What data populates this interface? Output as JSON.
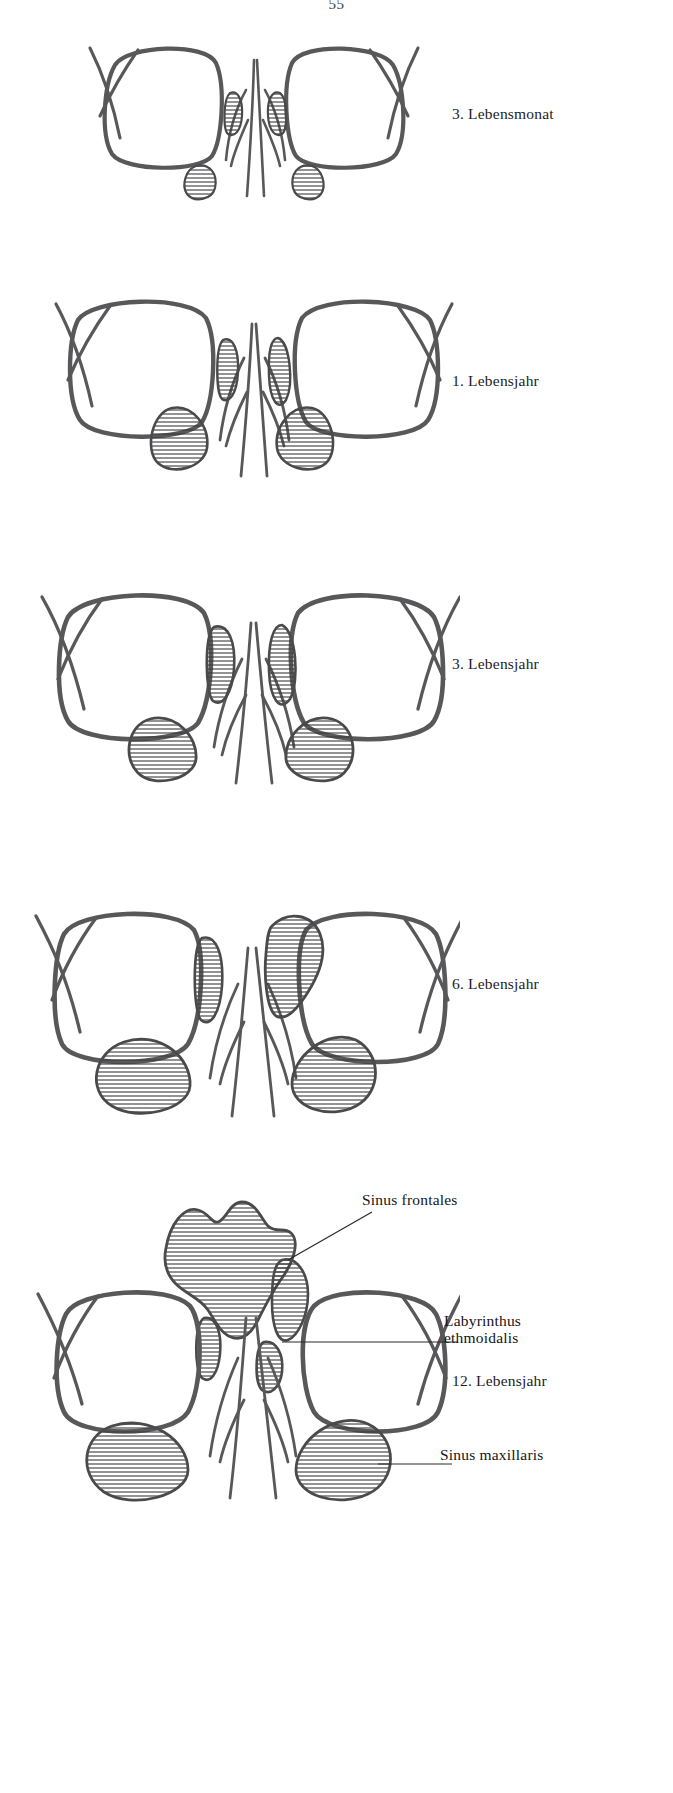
{
  "document": {
    "page_number": "55",
    "title": "Entwicklung der Nasennebenhöhlen",
    "ink_color": "#58585a",
    "text_color": "#1a1a1a",
    "background": "#ffffff"
  },
  "figures": [
    {
      "id": "fig-3-lebensmonat",
      "stage_label": "3. Lebensmonat",
      "label_x": 452,
      "label_y": 105,
      "top": 20,
      "sinus_scale": "very-small",
      "description": "Frontalschnitt mit Orbitae, Nasenseptum und Conchae; minimale Kieferhöhlen"
    },
    {
      "id": "fig-1-lebensjahr",
      "stage_label": "1. Lebensjahr",
      "label_x": 452,
      "label_y": 372,
      "top": 280,
      "sinus_scale": "small",
      "description": "Kieferhöhlen und Siebbeinzellen vergrößert"
    },
    {
      "id": "fig-3-lebensjahr",
      "stage_label": "3. Lebensjahr",
      "label_x": 452,
      "label_y": 662,
      "top": 575,
      "sinus_scale": "medium",
      "description": "Sinus maxillares deutlich ausgedehnt"
    },
    {
      "id": "fig-6-lebensjahr",
      "stage_label": "6. Lebensjahr",
      "label_x": 452,
      "label_y": 975,
      "top": 890,
      "sinus_scale": "large",
      "description": "Beginnende Pneumatisation der Stirnhöhle"
    },
    {
      "id": "fig-12-lebensjahr",
      "stage_label": "12. Lebensjahr",
      "label_x": 452,
      "label_y": 1381,
      "top": 1190,
      "sinus_scale": "adult",
      "description": "Sinus frontales, Labyrinthus ethmoidalis und Sinus maxillaris voll ausgebildet"
    }
  ],
  "annotations": [
    {
      "id": "anno-sinus-frontales",
      "text": "Sinus frontales",
      "label_x": 362,
      "label_y": 1199,
      "leader": {
        "x1": 358,
        "y1": 1213,
        "x2": 300,
        "y2": 1242
      }
    },
    {
      "id": "anno-labyrinthus-ethmoidalis",
      "line1": "Labyrinthus",
      "line2": "ethmoidalis",
      "label_x": 444,
      "label_y": 1323,
      "leader": {
        "x1": 440,
        "y1": 1341,
        "x2": 290,
        "y2": 1341
      }
    },
    {
      "id": "anno-sinus-maxillaris",
      "text": "Sinus maxillaris",
      "label_x": 440,
      "label_y": 1453,
      "leader": {
        "x1": 435,
        "y1": 1462,
        "x2": 385,
        "y2": 1462
      }
    }
  ],
  "legend": {
    "hatch_meaning": "schraffiert = pneumatisierte Nasennebenhöhle"
  }
}
